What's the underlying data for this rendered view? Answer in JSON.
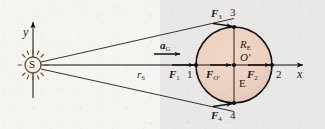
{
  "figure": {
    "background_left": "#f5f4f1",
    "background_right": "#e9e8e6",
    "earth_fill": "#eccfbf",
    "ink": "#111111"
  },
  "axes": {
    "y_label": "y",
    "x_label": "x"
  },
  "sun": {
    "label": "S",
    "name": "sun"
  },
  "earth": {
    "center_label": "O′",
    "body_label": "E",
    "radius_label": "R",
    "radius_sub": "E"
  },
  "distance": {
    "label": "r",
    "sub": "S"
  },
  "acceleration": {
    "label": "a",
    "sub": "G"
  },
  "forces": [
    {
      "label": "F",
      "sub": "1",
      "point": "1"
    },
    {
      "label": "F",
      "sub": "2",
      "point": "2"
    },
    {
      "label": "F",
      "sub": "3",
      "point": "3"
    },
    {
      "label": "F",
      "sub": "4",
      "point": "4"
    },
    {
      "label": "F",
      "sub": "O′",
      "point": ""
    }
  ],
  "points": {
    "p1": "1",
    "p2": "2",
    "p3": "3",
    "p4": "4"
  }
}
